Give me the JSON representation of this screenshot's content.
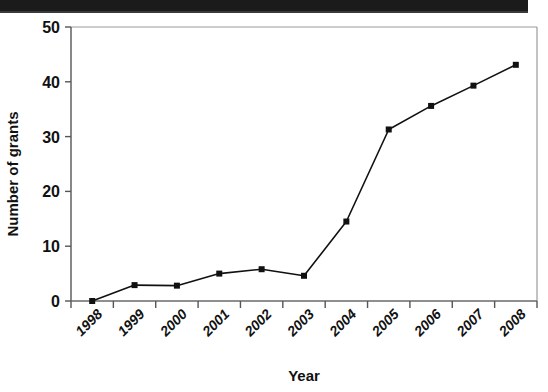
{
  "figure": {
    "background_color": "#ffffff",
    "scan_artifact_bar_color": "#1b1b1b"
  },
  "chart_data": {
    "type": "line",
    "title": "",
    "xlabel": "Year",
    "ylabel": "Number of grants",
    "categories": [
      "1998",
      "1999",
      "2000",
      "2001",
      "2002",
      "2003",
      "2004",
      "2005",
      "2006",
      "2007",
      "2008"
    ],
    "values": [
      0,
      2.9,
      2.8,
      5.0,
      5.8,
      4.6,
      14.5,
      31.3,
      35.6,
      39.3,
      43.1
    ],
    "series": [
      {
        "name": "Number of grants",
        "values": [
          0,
          2.9,
          2.8,
          5.0,
          5.8,
          4.6,
          14.5,
          31.3,
          35.6,
          39.3,
          43.1
        ],
        "line_color": "#111111",
        "marker": "square",
        "marker_color": "#111111"
      }
    ],
    "ylim": [
      0,
      50
    ],
    "yticks": [
      0,
      10,
      20,
      30,
      40,
      50
    ],
    "yticklabels": [
      "0",
      "10",
      "20",
      "30",
      "40",
      "50"
    ],
    "xticklabel_rotation": 45,
    "grid": false,
    "legend": false,
    "legend_position": "none",
    "axis_color": "#808080",
    "tick_color": "#555555"
  }
}
